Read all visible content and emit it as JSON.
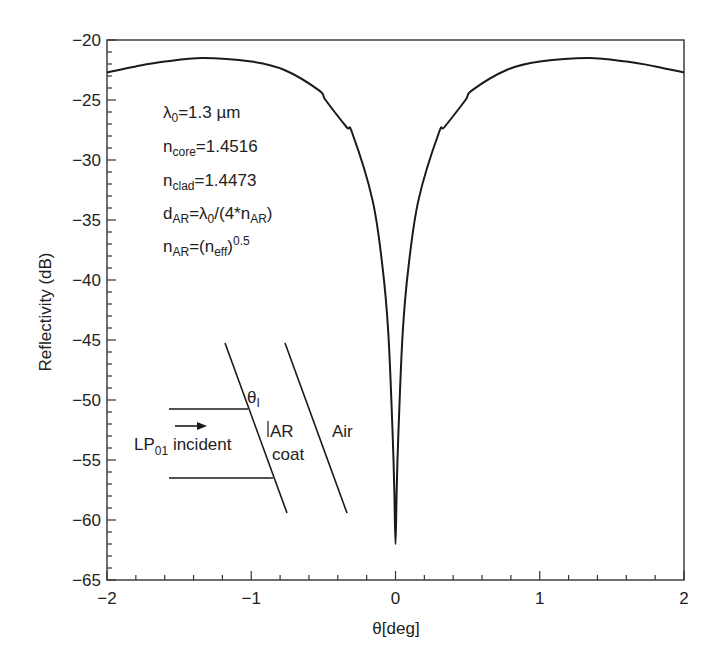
{
  "chart_data": {
    "type": "line",
    "title": "",
    "xlabel": "θ[deg]",
    "ylabel": "Reflectivity (dB)",
    "xlim": [
      -2,
      2
    ],
    "ylim": [
      -65,
      -20
    ],
    "x_ticks": [
      -2,
      -1,
      0,
      1,
      2
    ],
    "x_tick_labels": [
      "−2",
      "−1",
      "0",
      "1",
      "2"
    ],
    "x_minor_step": 0.2,
    "y_ticks": [
      -20,
      -25,
      -30,
      -35,
      -40,
      -45,
      -50,
      -55,
      -60,
      -65
    ],
    "y_tick_labels": [
      "−20",
      "−25",
      "−30",
      "−35",
      "−40",
      "−45",
      "−50",
      "−55",
      "−60",
      "−65"
    ],
    "y_minor_step": 1,
    "grid": false,
    "legend": null,
    "series": [
      {
        "name": "Reflectivity",
        "x": [
          -2.0,
          -1.8,
          -1.6,
          -1.34,
          -1.0,
          -0.77,
          -0.53,
          -0.485,
          -0.34,
          -0.3,
          -0.16,
          -0.09,
          -0.05,
          -0.02,
          -0.008,
          0.0,
          0.008,
          0.02,
          0.05,
          0.09,
          0.16,
          0.3,
          0.34,
          0.485,
          0.53,
          0.77,
          1.0,
          1.34,
          1.6,
          1.8,
          2.0
        ],
        "y": [
          -22.7,
          -22.2,
          -21.8,
          -21.5,
          -21.8,
          -22.5,
          -24.2,
          -25.0,
          -27.25,
          -27.75,
          -33.3,
          -38.9,
          -44.4,
          -52.75,
          -57.5,
          -62.0,
          -57.5,
          -52.75,
          -44.4,
          -38.9,
          -33.3,
          -27.75,
          -27.25,
          -25.0,
          -24.2,
          -22.5,
          -21.8,
          -21.5,
          -21.8,
          -22.2,
          -22.7
        ]
      }
    ],
    "annotations": {
      "params": [
        {
          "main": "λ",
          "sub": "0",
          "rest": "=1.3 µm"
        },
        {
          "main": "n",
          "sub": "core",
          "rest": "=1.4516"
        },
        {
          "main": "n",
          "sub": "clad",
          "rest": "=1.4473"
        },
        {
          "main": "d",
          "sub": "AR",
          "rest": "=λ",
          "sub2": "0",
          "rest2": "/(4*n",
          "sub3": "AR",
          "rest3": ")"
        },
        {
          "main": "n",
          "sub": "AR",
          "rest": "=(n",
          "sub2": "eff",
          "rest2": ")",
          "sup": "0.5"
        }
      ],
      "inset": {
        "incident_main": "LP",
        "incident_sub": "01",
        "incident_rest": " incident",
        "angle_label": "θ",
        "angle_sub": "I",
        "ar_label": "AR",
        "coat_label": "coat",
        "air_label": "Air"
      }
    }
  }
}
